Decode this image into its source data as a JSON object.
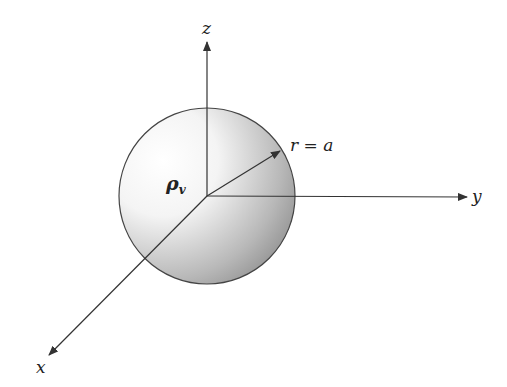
{
  "diagram": {
    "labels": {
      "z_axis": "z",
      "y_axis": "y",
      "x_axis": "x",
      "charge_density": "ρ",
      "charge_density_sub": "v",
      "radius": "r = a"
    },
    "colors": {
      "line": "#333333",
      "shade_light": "#ffffff",
      "shade_dark": "#8a8a8a"
    }
  }
}
